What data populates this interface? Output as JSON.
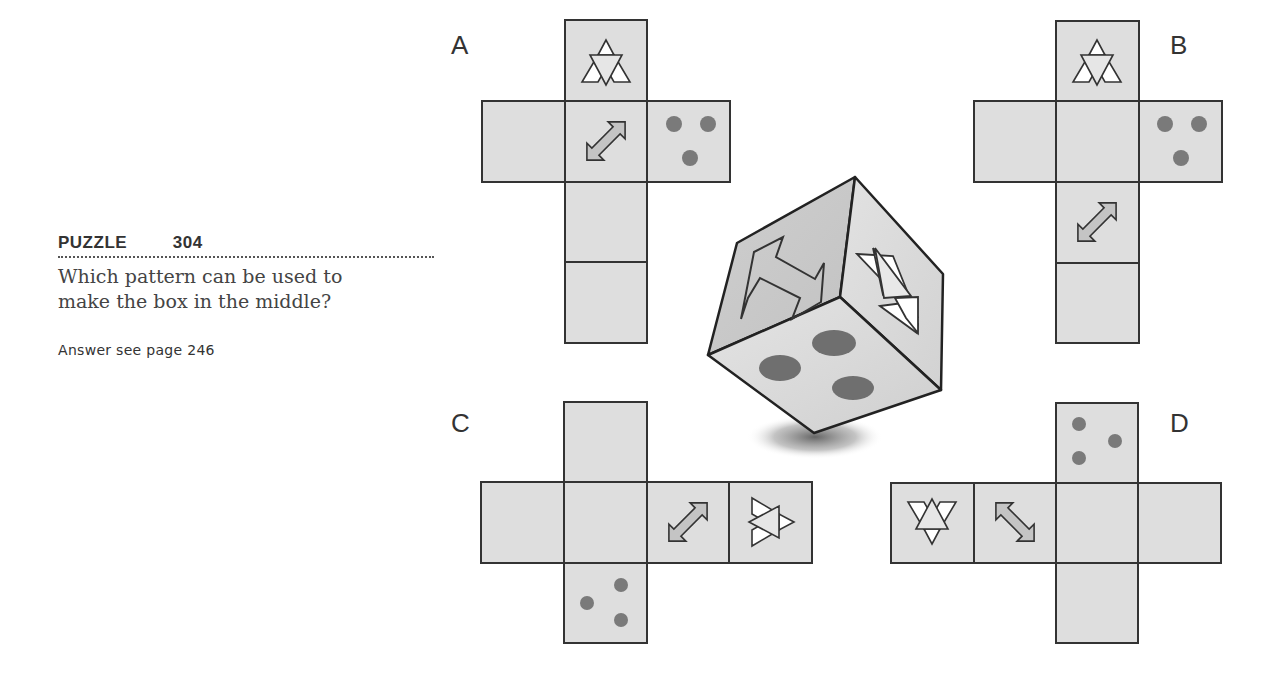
{
  "puzzle": {
    "title": "PUZZLE   304",
    "question": "Which pattern can be used to make the box in the middle?",
    "answer_ref": "Answer see page 246"
  },
  "options": [
    {
      "label": "A"
    },
    {
      "label": "B"
    },
    {
      "label": "C"
    },
    {
      "label": "D"
    }
  ],
  "icons": {
    "triangles": "triangle-cluster-icon",
    "arrow": "double-arrow-icon",
    "dots": "three-dots-icon"
  },
  "colors": {
    "face_fill": "#dedede",
    "stroke": "#333333",
    "dot": "#7a7a7a",
    "arrow_fill": "#c4c4c4"
  }
}
